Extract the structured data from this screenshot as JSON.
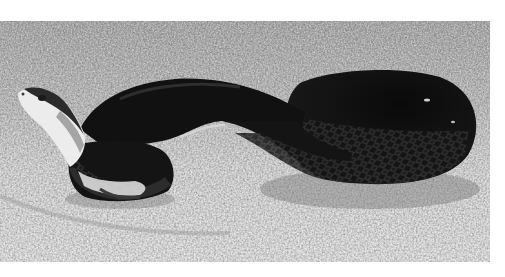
{
  "image": {
    "subject": "dark snake with pale head and throat on gravel",
    "style": "black-and-white photograph",
    "colors": {
      "border": "#ffffff",
      "ground_light": "#e4e4e4",
      "ground_mid": "#b4b4b4",
      "ground_dark": "#8e8e8e",
      "snake_body": "#121212",
      "snake_scale_highlight": "#4a4a4a",
      "snake_head_light": "#efefef"
    }
  }
}
